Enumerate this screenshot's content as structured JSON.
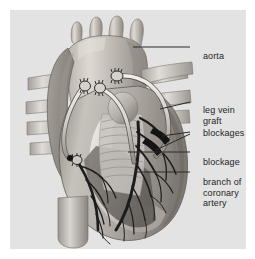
{
  "figure": {
    "panel_background": "#e3e3e3",
    "page_background": "#ffffff",
    "line_color": "#2a2a2a",
    "text_color": "#242424"
  },
  "labels": {
    "aorta": "aorta",
    "leg_vein_line1": "leg vein",
    "leg_vein_line2": "graft",
    "blockages": "blockages",
    "blockage": "blockage",
    "branch_line1": "branch of",
    "branch_line2": "coronary",
    "branch_line3": "artery"
  },
  "anatomy": {
    "aorta": "ascending aorta and arch with brachiocephalic, carotid and subclavian branches",
    "grafts": "saphenous leg vein bypass grafts from aorta to coronary arteries",
    "blockages": "atherosclerotic narrowings in coronary arteries",
    "coronary_branch": "branch of coronary artery over ventricle surface",
    "chambers": "right ventricle, left ventricle, atrium, pulmonary trunk, vena cava"
  },
  "colors": {
    "heart_light": "#cfcbc6",
    "heart_mid": "#a9a49e",
    "heart_dark": "#807b76",
    "heart_darker": "#6a6560",
    "vessel_light": "#d9d6d1",
    "graft": "#e8e6e2",
    "artery_dark": "#1f1f1f",
    "outline": "#4a4a4a"
  }
}
